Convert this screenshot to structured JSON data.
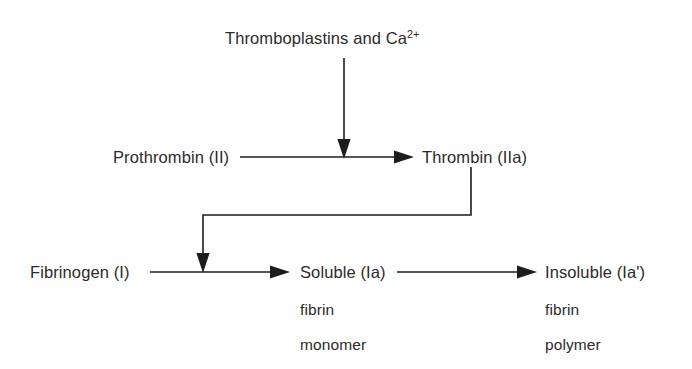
{
  "diagram": {
    "type": "flow-diagram",
    "background_color": "#ffffff",
    "text_color": "#2b2b2b",
    "arrow_color": "#1d1d1d",
    "nodes": [
      {
        "id": "thromboplastins",
        "label_prefix": "Thromboplastins and Ca",
        "label_sup": "2+",
        "full_text": "Thromboplastins and Ca2+",
        "x": 225,
        "y": 30
      },
      {
        "id": "prothrombin",
        "label": "Prothrombin (II)",
        "x": 113,
        "y": 149
      },
      {
        "id": "thrombin",
        "label": "Thrombin (IIa)",
        "x": 422,
        "y": 149
      },
      {
        "id": "fibrinogen",
        "label": "Fibrinogen (I)",
        "x": 30,
        "y": 264
      },
      {
        "id": "soluble",
        "label": "Soluble (Ia)",
        "x": 300,
        "y": 264
      },
      {
        "id": "insoluble",
        "label": "Insoluble (Ia')",
        "x": 545,
        "y": 264
      }
    ],
    "sub_labels": [
      {
        "id": "soluble-line2",
        "label": "fibrin",
        "x": 300,
        "y": 302
      },
      {
        "id": "soluble-line3",
        "label": "monomer",
        "x": 300,
        "y": 337
      },
      {
        "id": "insoluble-line2",
        "label": "fibrin",
        "x": 545,
        "y": 302
      },
      {
        "id": "insoluble-line3",
        "label": "polymer",
        "x": 545,
        "y": 337
      }
    ],
    "arrows": [
      {
        "id": "thromboplastins-to-conversion",
        "from": "thromboplastins",
        "to": "prothrombin-thrombin-arrow",
        "direction": "down"
      },
      {
        "id": "prothrombin-to-thrombin",
        "from": "prothrombin",
        "to": "thrombin",
        "direction": "right"
      },
      {
        "id": "thrombin-to-fibrin-conversion",
        "from": "thrombin",
        "to": "fibrinogen-soluble-arrow",
        "direction": "down-left-down"
      },
      {
        "id": "fibrinogen-to-soluble",
        "from": "fibrinogen",
        "to": "soluble",
        "direction": "right"
      },
      {
        "id": "soluble-to-insoluble",
        "from": "soluble",
        "to": "insoluble",
        "direction": "right"
      }
    ]
  }
}
